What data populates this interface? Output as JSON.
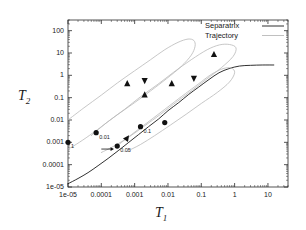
{
  "chart_data": {
    "type": "line",
    "title": "",
    "xlabel": "T_1",
    "ylabel": "T_2",
    "xscale": "log",
    "yscale": "log",
    "xlim": [
      1e-05,
      40
    ],
    "ylim": [
      1e-05,
      300
    ],
    "grid": false,
    "legend_position": "top-right",
    "xticks": [
      "1e-05",
      "0.0001",
      "0.001",
      "0.01",
      "0.1",
      "1",
      "10"
    ],
    "xtick_values": [
      1e-05,
      0.0001,
      0.001,
      0.01,
      0.1,
      1,
      10
    ],
    "yticks": [
      "1e-05",
      "0.0001",
      "0.001",
      "0.01",
      "0.1",
      "1",
      "10",
      "100"
    ],
    "ytick_values": [
      1e-05,
      0.0001,
      0.001,
      0.01,
      0.1,
      1,
      10,
      100
    ],
    "legend": [
      {
        "name": "Separatrix",
        "color": "#1a1a1a",
        "style": "solid"
      },
      {
        "name": "Trajectory",
        "color": "#b9b9b9",
        "style": "solid"
      }
    ],
    "series": [
      {
        "name": "Separatrix",
        "color": "#1a1a1a",
        "points": [
          [
            1e-05,
            1.4e-05
          ],
          [
            2e-05,
            2.4e-05
          ],
          [
            4e-05,
            4.4e-05
          ],
          [
            8e-05,
            9e-05
          ],
          [
            0.00016,
            0.00019
          ],
          [
            0.00032,
            0.00042
          ],
          [
            0.00064,
            0.00095
          ],
          [
            0.0013,
            0.0022
          ],
          [
            0.0026,
            0.005
          ],
          [
            0.0052,
            0.011
          ],
          [
            0.01,
            0.026
          ],
          [
            0.021,
            0.06
          ],
          [
            0.042,
            0.14
          ],
          [
            0.084,
            0.3
          ],
          [
            0.17,
            0.65
          ],
          [
            0.34,
            1.3
          ],
          [
            0.68,
            2.0
          ],
          [
            1.4,
            2.6
          ],
          [
            3.0,
            2.8
          ],
          [
            7.0,
            2.9
          ],
          [
            15.0,
            2.9
          ]
        ]
      },
      {
        "name": "Trajectory-outer",
        "color": "#b9b9b9",
        "points": [
          [
            1e-05,
            0.01
          ],
          [
            3e-05,
            0.035
          ],
          [
            0.0001,
            0.13
          ],
          [
            0.0003,
            0.45
          ],
          [
            0.001,
            1.6
          ],
          [
            0.003,
            5.0
          ],
          [
            0.008,
            14.0
          ],
          [
            0.02,
            30.0
          ],
          [
            0.04,
            42.0
          ],
          [
            0.06,
            36.0
          ],
          [
            0.065,
            20.0
          ],
          [
            0.05,
            8.0
          ],
          [
            0.025,
            2.5
          ],
          [
            0.009,
            0.7
          ],
          [
            0.003,
            0.2
          ],
          [
            0.001,
            0.06
          ],
          [
            0.0003,
            0.017
          ],
          [
            0.0001,
            0.005
          ],
          [
            3.5e-05,
            0.0016
          ],
          [
            1.5e-05,
            0.0007
          ],
          [
            1e-05,
            0.0005
          ]
        ]
      },
      {
        "name": "Trajectory-middle",
        "color": "#b9b9b9",
        "points": [
          [
            5e-05,
            0.002
          ],
          [
            0.00015,
            0.008
          ],
          [
            0.0005,
            0.03
          ],
          [
            0.0015,
            0.11
          ],
          [
            0.005,
            0.4
          ],
          [
            0.015,
            1.4
          ],
          [
            0.05,
            5.0
          ],
          [
            0.15,
            14.0
          ],
          [
            0.35,
            23.0
          ],
          [
            0.7,
            24.0
          ],
          [
            1.1,
            17.0
          ],
          [
            0.9,
            7.0
          ],
          [
            0.4,
            2.2
          ],
          [
            0.14,
            0.65
          ],
          [
            0.05,
            0.2
          ],
          [
            0.017,
            0.06
          ],
          [
            0.006,
            0.018
          ],
          [
            0.002,
            0.0055
          ],
          [
            0.0007,
            0.0018
          ],
          [
            0.00025,
            0.0007
          ],
          [
            0.0001,
            0.00035
          ]
        ]
      },
      {
        "name": "Trajectory-inner",
        "color": "#b9b9b9",
        "points": [
          [
            0.0003,
            0.0007
          ],
          [
            0.0008,
            0.0022
          ],
          [
            0.0025,
            0.008
          ],
          [
            0.008,
            0.03
          ],
          [
            0.025,
            0.11
          ],
          [
            0.08,
            0.4
          ],
          [
            0.2,
            1.1
          ],
          [
            0.45,
            2.0
          ],
          [
            0.8,
            2.1
          ],
          [
            1.0,
            1.3
          ],
          [
            0.7,
            0.5
          ],
          [
            0.3,
            0.17
          ],
          [
            0.1,
            0.055
          ],
          [
            0.035,
            0.018
          ],
          [
            0.012,
            0.006
          ],
          [
            0.004,
            0.002
          ],
          [
            0.0015,
            0.0008
          ],
          [
            0.0006,
            0.0004
          ]
        ]
      }
    ],
    "markers": [
      {
        "label": "1",
        "x": 1e-05,
        "y": 0.001,
        "shape": "circle"
      },
      {
        "label": "0.01",
        "x": 7e-05,
        "y": 0.0027,
        "shape": "circle"
      },
      {
        "label": "0.05",
        "x": 0.0003,
        "y": 0.00068,
        "shape": "circle"
      },
      {
        "label": "0.1",
        "x": 0.0015,
        "y": 0.005,
        "shape": "circle"
      },
      {
        "label": "",
        "x": 0.008,
        "y": 0.0077,
        "shape": "circle"
      }
    ],
    "arrows": [
      {
        "x": 0.0006,
        "y": 0.0016,
        "shape": "triangle-up",
        "angle": 35
      },
      {
        "x": 0.0006,
        "y": 0.45,
        "shape": "triangle-up",
        "angle": 0
      },
      {
        "x": 0.002,
        "y": 0.55,
        "shape": "triangle-down",
        "angle": 0
      },
      {
        "x": 0.002,
        "y": 0.14,
        "shape": "triangle-up",
        "angle": 0
      },
      {
        "x": 0.013,
        "y": 0.45,
        "shape": "triangle-up",
        "angle": 0
      },
      {
        "x": 0.06,
        "y": 0.7,
        "shape": "triangle-down",
        "angle": 0
      },
      {
        "x": 0.24,
        "y": 9.0,
        "shape": "triangle-up",
        "angle": 0
      }
    ],
    "flow_arrow": {
      "x0": 0.0001,
      "y0": 0.0005,
      "x1": 0.00024,
      "y1": 0.0005
    }
  }
}
